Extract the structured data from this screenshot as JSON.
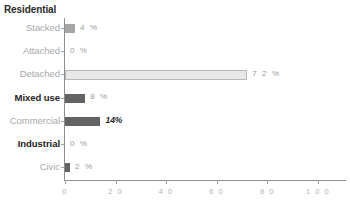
{
  "chart_data": {
    "type": "bar",
    "orientation": "horizontal",
    "title": "Residential",
    "xlabel": "",
    "ylabel": "",
    "xlim": [
      0,
      100
    ],
    "grid": false,
    "legend": "none",
    "categories": [
      "Stacked",
      "Attached",
      "Detached",
      "Mixed use",
      "Commercial",
      "Industrial",
      "Civic"
    ],
    "values": [
      4,
      0,
      72,
      8,
      14,
      0,
      2
    ],
    "value_labels": [
      "4 %",
      "0 %",
      "7 2 %",
      "8 %",
      "14%",
      "0 %",
      "2 %"
    ],
    "xticks": [
      0,
      20,
      40,
      60,
      80,
      100
    ],
    "xtick_labels": [
      "0",
      "2 0",
      "4 0",
      "6 0",
      "8 0",
      "1 0 0"
    ],
    "bar_styles": [
      "light",
      "zero",
      "pale",
      "dark",
      "dark",
      "zero",
      "dark"
    ],
    "label_styles": [
      "muted",
      "muted",
      "muted",
      "strong",
      "muted",
      "strong",
      "muted"
    ],
    "value_label_styles": [
      "muted",
      "muted",
      "muted",
      "muted",
      "emph",
      "muted",
      "muted"
    ],
    "colors": {
      "bar_dark": "#636363",
      "bar_light": "#a5a5a5",
      "bar_pale": "#e8e8e8",
      "bar_pale_border": "#b9b9b9",
      "axis": "#8e8e8e",
      "label_muted": "#a8a8a8",
      "label_strong": "#232323",
      "tick_label": "#b2b2b2",
      "background": "#ffffff"
    }
  },
  "rows": [
    {
      "label": "Stacked",
      "value_label": "4 %"
    },
    {
      "label": "Attached",
      "value_label": "0 %"
    },
    {
      "label": "Detached",
      "value_label": "7 2 %"
    },
    {
      "label": "Mixed use",
      "value_label": "8 %"
    },
    {
      "label": "Commercial",
      "value_label": "14%"
    },
    {
      "label": "Industrial",
      "value_label": "0 %"
    },
    {
      "label": "Civic",
      "value_label": "2 %"
    }
  ],
  "xaxis": {
    "labels": [
      "0",
      "2 0",
      "4 0",
      "6 0",
      "8 0",
      "1 0 0"
    ]
  }
}
